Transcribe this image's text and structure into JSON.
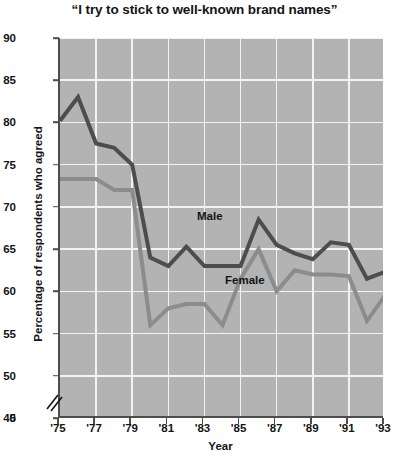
{
  "chart_data": {
    "type": "line",
    "title": "“I try  to stick to well-known brand names”",
    "xlabel": "Year",
    "ylabel": "Percentage of respondents who agreed",
    "xlim": [
      1975,
      1993
    ],
    "ylim": [
      45,
      90
    ],
    "y_axis_break": true,
    "y_axis_break_symbol": "⁄⁄",
    "grid": true,
    "legend": "inline-labels",
    "x": [
      1975,
      1976,
      1977,
      1978,
      1979,
      1980,
      1981,
      1982,
      1983,
      1984,
      1985,
      1986,
      1987,
      1988,
      1989,
      1990,
      1991,
      1992,
      1993
    ],
    "xtick_labels": [
      "'75",
      "'77",
      "'79",
      "'81",
      "'83",
      "'85",
      "'87",
      "'89",
      "'91",
      "'93"
    ],
    "xtick_values": [
      1975,
      1977,
      1979,
      1981,
      1983,
      1985,
      1987,
      1989,
      1991,
      1993
    ],
    "ytick_labels": [
      "0",
      "45",
      "50",
      "55",
      "60",
      "65",
      "70",
      "75",
      "80",
      "85",
      "90"
    ],
    "ytick_values": [
      0,
      45,
      50,
      55,
      60,
      65,
      70,
      75,
      80,
      85,
      90
    ],
    "series": [
      {
        "name": "Male",
        "color": "#4d4d4d",
        "values": [
          80.2,
          83.0,
          77.5,
          77.0,
          75.0,
          64.0,
          63.0,
          65.3,
          63.0,
          63.0,
          63.0,
          68.5,
          65.5,
          64.5,
          63.8,
          65.8,
          65.5,
          61.5,
          62.3
        ]
      },
      {
        "name": "Female",
        "color": "#8c8c8c",
        "values": [
          73.3,
          73.3,
          73.3,
          72.0,
          72.0,
          56.0,
          58.0,
          58.5,
          58.5,
          56.0,
          61.5,
          65.0,
          60.0,
          62.5,
          62.0,
          62.0,
          61.8,
          56.5,
          59.5
        ]
      }
    ]
  },
  "axis_label_y": "Percentage of respondents who agreed",
  "axis_label_x": "Year",
  "colors": {
    "plot_background": "#b3b3b3",
    "gridline": "#f2f2f2",
    "axis": "#4d4d4d",
    "male": "#4d4d4d",
    "female": "#8c8c8c",
    "page_background": "#ffffff"
  }
}
